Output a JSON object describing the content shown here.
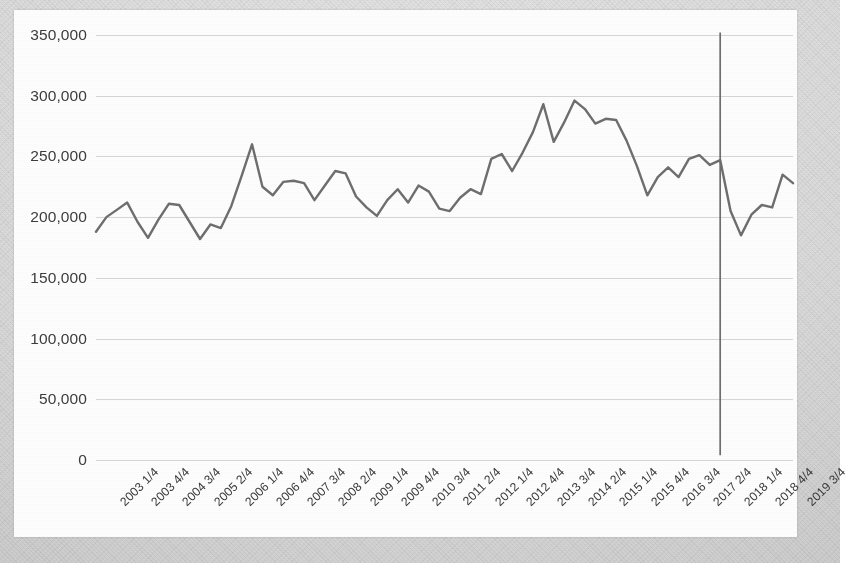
{
  "chart_data": {
    "type": "line",
    "title": "",
    "subtitle": "",
    "xlabel": "",
    "ylabel": "",
    "ylim": [
      0,
      350000
    ],
    "ytick_step": 50000,
    "ytick_labels": [
      "350,000",
      "300,000",
      "250,000",
      "200,000",
      "150,000",
      "100,000",
      "50,000",
      "0"
    ],
    "ytick_values": [
      350000,
      300000,
      250000,
      200000,
      150000,
      100000,
      50000,
      0
    ],
    "grid": true,
    "grid_axis": "y",
    "legend": false,
    "legend_position": "none",
    "xtick_interval_quarters": 3,
    "xtick_labels": [
      "2003 1/4",
      "2003 4/4",
      "2004 3/4",
      "2005 2/4",
      "2006 1/4",
      "2006 4/4",
      "2007 3/4",
      "2008 2/4",
      "2009 1/4",
      "2009 4/4",
      "2010 3/4",
      "2011 2/4",
      "2012 1/4",
      "2012 4/4",
      "2013 3/4",
      "2014 2/4",
      "2015 1/4",
      "2015 4/4",
      "2016 3/4",
      "2017 2/4",
      "2018 1/4",
      "2018 4/4",
      "2019 3/4"
    ],
    "x": [
      "2003 1/4",
      "2003 2/4",
      "2003 3/4",
      "2003 4/4",
      "2004 1/4",
      "2004 2/4",
      "2004 3/4",
      "2004 4/4",
      "2005 1/4",
      "2005 2/4",
      "2005 3/4",
      "2005 4/4",
      "2006 1/4",
      "2006 2/4",
      "2006 3/4",
      "2006 4/4",
      "2007 1/4",
      "2007 2/4",
      "2007 3/4",
      "2007 4/4",
      "2008 1/4",
      "2008 2/4",
      "2008 3/4",
      "2008 4/4",
      "2009 1/4",
      "2009 2/4",
      "2009 3/4",
      "2009 4/4",
      "2010 1/4",
      "2010 2/4",
      "2010 3/4",
      "2010 4/4",
      "2011 1/4",
      "2011 2/4",
      "2011 3/4",
      "2011 4/4",
      "2012 1/4",
      "2012 2/4",
      "2012 3/4",
      "2012 4/4",
      "2013 1/4",
      "2013 2/4",
      "2013 3/4",
      "2013 4/4",
      "2014 1/4",
      "2014 2/4",
      "2014 3/4",
      "2014 4/4",
      "2015 1/4",
      "2015 2/4",
      "2015 3/4",
      "2015 4/4",
      "2016 1/4",
      "2016 2/4",
      "2016 3/4",
      "2016 4/4",
      "2017 1/4",
      "2017 2/4",
      "2017 3/4",
      "2017 4/4",
      "2018 1/4",
      "2018 2/4",
      "2018 3/4",
      "2018 4/4",
      "2019 1/4",
      "2019 2/4",
      "2019 3/4",
      "2019 4/4"
    ],
    "series": [
      {
        "name": "Quarterly value",
        "color": "#6e6e6e",
        "values": [
          188000,
          200000,
          206000,
          212000,
          196000,
          183000,
          198000,
          211000,
          210000,
          196000,
          182000,
          194000,
          191000,
          209000,
          234000,
          260000,
          225000,
          218000,
          229000,
          230000,
          228000,
          214000,
          226000,
          238000,
          236000,
          217000,
          208000,
          201000,
          214000,
          223000,
          212000,
          226000,
          221000,
          207000,
          205000,
          216000,
          223000,
          219000,
          248000,
          252000,
          238000,
          253000,
          270000,
          293000,
          262000,
          278000,
          296000,
          289000,
          277000,
          281000,
          280000,
          263000,
          242000,
          218000,
          233000,
          241000,
          233000,
          248000,
          251000,
          243000,
          247000,
          205000,
          185000,
          202000,
          210000,
          208000,
          235000,
          228000
        ]
      }
    ],
    "annotations": [
      {
        "type": "vertical-line",
        "name": "event-marker-2018q1",
        "x": "2018 1/4",
        "y_top": 352000,
        "y_bottom": 4000,
        "color": "#6e6e6e",
        "label": ""
      }
    ]
  },
  "accessibility": {
    "chart_description": "Line chart of quarterly values from 2003 1/4 to 2019 4/4 with a vertical marker at 2018 1/4"
  }
}
